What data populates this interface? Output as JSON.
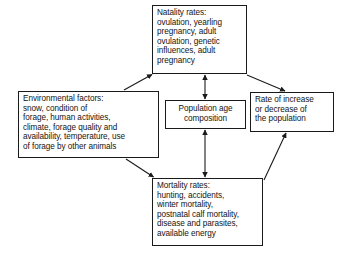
{
  "diagram": {
    "background_color": "#ffffff",
    "line_color": "#1a1a1a",
    "text_color": "#141414",
    "nodes": {
      "natality": {
        "name": "natality-rates",
        "text": "Natality rates:\novulation, yearling\npregnancy, adult\novulation, genetic\ninfluences, adult\npregnancy"
      },
      "environmental": {
        "name": "environmental-factors",
        "text": "Environmental factors:\nsnow, condition of\nforage, human activities,\nclimate, forage quality and\navailability, temperature, use\nof forage by other animals"
      },
      "population": {
        "name": "population-age-composition",
        "text": "Population age\ncomposition"
      },
      "rate": {
        "name": "rate-of-increase-or-decrease",
        "text": "Rate of increase\nor decrease of\nthe population"
      },
      "mortality": {
        "name": "mortality-rates",
        "text": "Mortality rates:\nhunting, accidents,\nwinter mortality,\npostnatal calf mortality,\ndisease and parasites,\navailable energy"
      }
    },
    "edges": [
      {
        "id": "environmental-to-natality",
        "from": "environmental",
        "to": "natality",
        "style": "single-arrow",
        "direction": "up-right"
      },
      {
        "id": "environmental-to-mortality",
        "from": "environmental",
        "to": "mortality",
        "style": "single-arrow",
        "direction": "down-right"
      },
      {
        "id": "natality-to-population",
        "from": "natality",
        "to": "population",
        "style": "double-arrow",
        "direction": "vertical"
      },
      {
        "id": "population-to-mortality",
        "from": "population",
        "to": "mortality",
        "style": "double-arrow",
        "direction": "vertical"
      },
      {
        "id": "natality-to-rate",
        "from": "natality",
        "to": "rate",
        "style": "single-arrow",
        "direction": "down-right"
      },
      {
        "id": "mortality-to-rate",
        "from": "mortality",
        "to": "rate",
        "style": "single-arrow",
        "direction": "up-right"
      }
    ]
  }
}
